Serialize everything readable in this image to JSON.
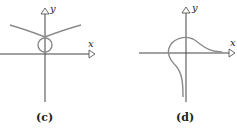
{
  "figures": [
    {
      "id": "c",
      "caption": "(c)",
      "x_label": "x",
      "y_label": "y",
      "description": "V-shaped curve with vertex on positive y-axis above a small loop (circle) tangent to the origin"
    },
    {
      "id": "d",
      "caption": "(d)",
      "x_label": "x",
      "y_label": "y",
      "description": "Curve coming from lower left near negative y, looping up through the left of the origin over the top of the y-axis and decaying toward the positive x-axis"
    }
  ],
  "colors": {
    "axis": "#444444",
    "curve": "#8a8a8a",
    "text": "#222222"
  }
}
